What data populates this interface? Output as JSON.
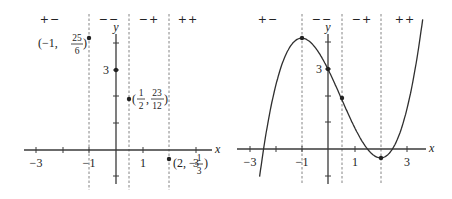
{
  "function": "f(x) = x^3/3 - x^2/2 - 2x + 3",
  "sign_labels": [
    "+−",
    "−−",
    "−+",
    "++"
  ],
  "axis_labels": {
    "x": "x",
    "y": "y"
  },
  "x_tick_labels": [
    "−3",
    "−1",
    "1",
    "3"
  ],
  "y_tick_labels": [
    "3"
  ],
  "left_graph": {
    "points": [
      {
        "x": -1,
        "y": 4.1667,
        "label_pre": "(−1,",
        "num": "25",
        "den": "6",
        "label_post": ")"
      },
      {
        "x": 0,
        "y": 3
      },
      {
        "x": 0.5,
        "y": 1.9167,
        "label_pre": "(",
        "num1": "1",
        "den1": "2",
        "mid": ",",
        "num": "23",
        "den": "12",
        "label_post": ")"
      },
      {
        "x": 2,
        "y": -0.3333,
        "label_pre": "(2, −",
        "num": "1",
        "den": "3",
        "label_post": ")"
      }
    ]
  },
  "right_graph": {
    "points": [
      {
        "x": -1,
        "y": 4.1667
      },
      {
        "x": 0,
        "y": 3
      },
      {
        "x": 0.5,
        "y": 1.9167
      },
      {
        "x": 2,
        "y": -0.3333
      }
    ]
  },
  "critical_x": [
    -1,
    0.5,
    2
  ],
  "chart_data": {
    "type": "line",
    "title": "",
    "xlabel": "x",
    "ylabel": "y",
    "region_signs": [
      "+−",
      "−−",
      "−+",
      "++"
    ],
    "divider_x": [
      -1,
      0.5,
      2
    ],
    "series": [
      {
        "name": "critical / inflection points",
        "x": [
          -1,
          0,
          0.5,
          2
        ],
        "y": [
          4.1667,
          3,
          1.9167,
          -0.3333
        ]
      },
      {
        "name": "f(x) = x³/3 − x²/2 − 2x + 3",
        "x": [
          -2.6,
          -2,
          -1,
          0,
          0.5,
          1,
          2,
          3,
          3.6
        ],
        "y": [
          -0.66,
          2.33,
          4.17,
          3,
          1.92,
          0.83,
          -0.33,
          1.5,
          4.75
        ]
      }
    ],
    "xlim": [
      -3.5,
      3.8
    ],
    "ylim": [
      -1.5,
      4.8
    ],
    "xticks": [
      -3,
      -1,
      1,
      3
    ],
    "yticks": [
      3
    ]
  }
}
